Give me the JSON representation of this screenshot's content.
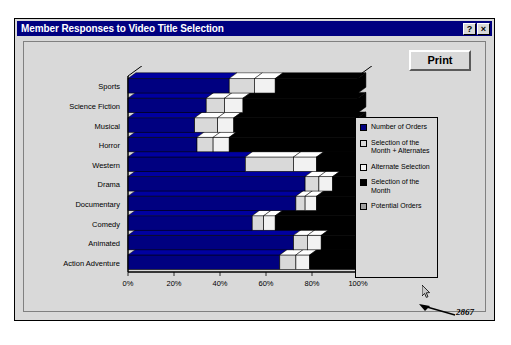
{
  "window": {
    "title": "Member Responses to Video Title Selection",
    "help_button": "?",
    "close_button": "×"
  },
  "toolbar": {
    "print_label": "Print"
  },
  "annotation": {
    "value": "2867",
    "cursor_icon": "mouse-pointer-icon",
    "arrow_icon": "arrow-icon"
  },
  "legend": {
    "position": "right",
    "items": [
      {
        "label": "Number of Orders",
        "color": "#000080"
      },
      {
        "label": "Selection of the Month + Alternates",
        "color": "#d9d9d9"
      },
      {
        "label": "Alternate Selection",
        "color": "#f2f2f2"
      },
      {
        "label": "Selection of the Month",
        "color": "#000000"
      },
      {
        "label": "Potential Orders",
        "color": "#a0a0a0"
      }
    ]
  },
  "chart_data": {
    "type": "bar",
    "orientation": "horizontal",
    "stacked": true,
    "title": "Member Responses to Video Title Selection",
    "xlabel": "",
    "ylabel": "",
    "xlim": [
      0,
      100
    ],
    "xticks": [
      0,
      20,
      40,
      60,
      80,
      100
    ],
    "xticklabels": [
      "0%",
      "20%",
      "40%",
      "60%",
      "80%",
      "100%"
    ],
    "grid": false,
    "categories": [
      "Action Adventure",
      "Animated",
      "Comedy",
      "Documentary",
      "Drama",
      "Western",
      "Horror",
      "Musical",
      "Science Fiction",
      "Sports"
    ],
    "series": [
      {
        "name": "Number of Orders",
        "color": "#000080",
        "values": [
          66,
          72,
          54,
          73,
          77,
          51,
          30,
          29,
          34,
          44
        ]
      },
      {
        "name": "Selection of the Month + Alternates",
        "color": "#d9d9d9",
        "values": [
          7,
          6,
          5,
          4,
          6,
          21,
          7,
          10,
          8,
          11
        ]
      },
      {
        "name": "Alternate Selection",
        "color": "#f2f2f2",
        "values": [
          6,
          6,
          5,
          5,
          6,
          10,
          7,
          7,
          8,
          9
        ]
      },
      {
        "name": "Selection of the Month",
        "color": "#000000",
        "values": [
          21,
          16,
          36,
          18,
          11,
          18,
          56,
          54,
          50,
          36
        ]
      }
    ]
  }
}
